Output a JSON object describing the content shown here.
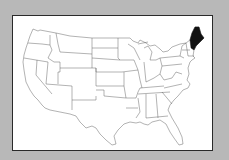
{
  "map": {
    "region": "Contiguous United States",
    "highlighted_state": "Maine",
    "colors": {
      "background": "#b8b8b8",
      "frame_fill": "#ffffff",
      "frame_border": "#2a2a2a",
      "state_fill": "#ffffff",
      "state_border": "#555555",
      "highlight_fill": "#111111"
    }
  }
}
